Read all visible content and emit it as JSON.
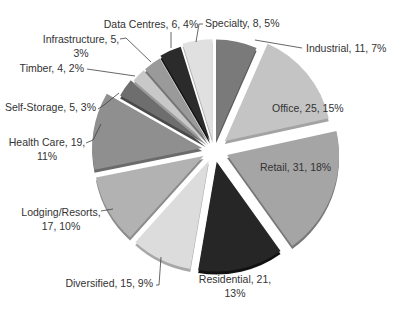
{
  "chart_data": {
    "type": "pie",
    "title": "",
    "exploded": true,
    "start_angle_deg": 0,
    "direction": "clockwise",
    "center": [
      214,
      150
    ],
    "radius": 112,
    "slices": [
      {
        "name": "Industrial",
        "value": 11,
        "percent": "7%",
        "label": "Industrial, 11, 7%",
        "color": "#7a7a7a",
        "shade": "#5c5c5c",
        "explode": 10,
        "r": 0.9
      },
      {
        "name": "Office",
        "value": 25,
        "percent": "15%",
        "label": "Office, 25, 15%",
        "color": "#c4c4c4",
        "shade": "#a3a3a3",
        "explode": 14,
        "r": 0.95
      },
      {
        "name": "Retail",
        "value": 31,
        "percent": "18%",
        "label": "Retail, 31, 18%",
        "color": "#a5a5a5",
        "shade": "#787878",
        "explode": 14,
        "r": 1.0
      },
      {
        "name": "Residential",
        "value": 21,
        "percent": "13%",
        "label": "Residential, 21, 13%",
        "color": "#262626",
        "shade": "#111111",
        "explode": 12,
        "r": 0.98
      },
      {
        "name": "Diversified",
        "value": 15,
        "percent": "9%",
        "label": "Diversified, 15, 9%",
        "color": "#dcdcdc",
        "shade": "#a8a8a8",
        "explode": 12,
        "r": 0.98
      },
      {
        "name": "Lodging/Resorts",
        "value": 17,
        "percent": "10%",
        "label": "Lodging/Resorts, 17, 10%",
        "color": "#b2b2b2",
        "shade": "#8c8c8c",
        "explode": 12,
        "r": 0.98
      },
      {
        "name": "Health Care",
        "value": 19,
        "percent": "11%",
        "label": "Health Care, 19, 11%",
        "color": "#8f8f8f",
        "shade": "#6b6b6b",
        "explode": 12,
        "r": 0.98
      },
      {
        "name": "Self-Storage",
        "value": 5,
        "percent": "3%",
        "label": "Self-Storage, 5, 3%",
        "color": "#6e6e6e",
        "shade": "#4a4a4a",
        "explode": 10,
        "r": 0.88
      },
      {
        "name": "Timber",
        "value": 4,
        "percent": "2%",
        "label": "Timber, 4, 2%",
        "color": "#c8c8c8",
        "shade": "#9a9a9a",
        "explode": 10,
        "r": 0.86
      },
      {
        "name": "Infrastructure",
        "value": 5,
        "percent": "3%",
        "label": "Infrastructure, 5, 3%",
        "color": "#9a9a9a",
        "shade": "#757575",
        "explode": 10,
        "r": 0.86
      },
      {
        "name": "Data Centres",
        "value": 6,
        "percent": "4%",
        "label": "Data Centres, 6, 4%",
        "color": "#2b2b2b",
        "shade": "#151515",
        "explode": 10,
        "r": 0.88
      },
      {
        "name": "Specialty",
        "value": 8,
        "percent": "5%",
        "label": "Specialty, 8, 5%",
        "color": "#e0e0e0",
        "shade": "#b0b0b0",
        "explode": 10,
        "r": 0.9
      }
    ],
    "labels": [
      {
        "lines": [
          "Industrial, 11, 7%"
        ],
        "x": 306,
        "y": 52,
        "anchor": "start",
        "leader": [
          [
            302,
            48
          ],
          [
            255,
            40
          ]
        ]
      },
      {
        "lines": [
          "Office, 25, 15%"
        ],
        "x": 272,
        "y": 112,
        "anchor": "start",
        "leader": null
      },
      {
        "lines": [
          "Retail, 31, 18%"
        ],
        "x": 260,
        "y": 171,
        "anchor": "start",
        "leader": null
      },
      {
        "lines": [
          "Residential, 21,",
          "13%"
        ],
        "x": 235,
        "y": 283,
        "anchor": "middle",
        "leader": null
      },
      {
        "lines": [
          "Diversified, 15, 9%"
        ],
        "x": 153,
        "y": 287,
        "anchor": "end",
        "leader": [
          [
            156,
            285
          ],
          [
            159,
            285
          ],
          [
            161,
            257
          ]
        ]
      },
      {
        "lines": [
          "Lodging/Resorts,",
          "17, 10%"
        ],
        "x": 61,
        "y": 216,
        "anchor": "middle",
        "leader": [
          [
            101,
            211
          ],
          [
            113,
            209
          ]
        ]
      },
      {
        "lines": [
          "Health Care, 19,",
          "11%"
        ],
        "x": 47,
        "y": 146,
        "anchor": "middle",
        "leader": [
          [
            86,
            143
          ],
          [
            93,
            140
          ],
          [
            101,
            124
          ]
        ]
      },
      {
        "lines": [
          "Self-Storage, 5, 3%"
        ],
        "x": 96,
        "y": 111,
        "anchor": "end",
        "leader": [
          [
            98,
            109
          ],
          [
            104,
            105
          ],
          [
            119,
            93
          ]
        ]
      },
      {
        "lines": [
          "Timber, 4, 2%"
        ],
        "x": 84,
        "y": 72,
        "anchor": "end",
        "leader": [
          [
            87,
            69
          ],
          [
            135,
            76
          ]
        ]
      },
      {
        "lines": [
          "Infrastructure, 5,",
          "3%"
        ],
        "x": 81,
        "y": 43,
        "anchor": "middle",
        "leader": [
          [
            120,
            39
          ],
          [
            126,
            38
          ],
          [
            151,
            62
          ]
        ]
      },
      {
        "lines": [
          "Data Centres, 6, 4%"
        ],
        "x": 151,
        "y": 28,
        "anchor": "middle",
        "leader": [
          [
            171,
            32
          ],
          [
            171,
            48
          ]
        ]
      },
      {
        "lines": [
          "Specialty, 8, 5%"
        ],
        "x": 205,
        "y": 27,
        "anchor": "start",
        "leader": [
          [
            203,
            24
          ],
          [
            199,
            24
          ],
          [
            196,
            42
          ]
        ]
      }
    ]
  }
}
